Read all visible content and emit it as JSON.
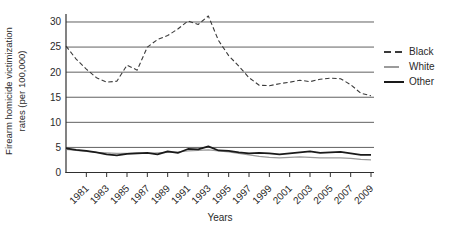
{
  "chart_data": {
    "type": "line",
    "title": "",
    "xlabel": "Years",
    "ylabel": "Firearm homicide victimization rates (per 100,000)",
    "ylabel_line1": "Firearm homicide victimization",
    "ylabel_line2": "rates (per 100,000)",
    "x": [
      1979,
      1980,
      1981,
      1982,
      1983,
      1984,
      1985,
      1986,
      1987,
      1988,
      1989,
      1990,
      1991,
      1992,
      1993,
      1994,
      1995,
      1996,
      1997,
      1998,
      1999,
      2000,
      2001,
      2002,
      2003,
      2004,
      2005,
      2006,
      2007,
      2008,
      2009
    ],
    "series": [
      {
        "name": "Black",
        "style": "dashed",
        "color": "#3a3a3a",
        "width": 1.1,
        "values": [
          25.2,
          22.6,
          20.6,
          18.9,
          18.0,
          18.2,
          21.4,
          20.4,
          25.0,
          26.5,
          27.3,
          28.6,
          30.2,
          29.5,
          31.2,
          26.3,
          23.3,
          21.2,
          18.9,
          17.4,
          17.3,
          17.7,
          18.0,
          18.4,
          18.1,
          18.6,
          18.8,
          18.7,
          17.5,
          15.8,
          15.3
        ]
      },
      {
        "name": "White",
        "style": "solid",
        "color": "#9b9b9b",
        "width": 1.3,
        "values": [
          4.6,
          4.4,
          4.2,
          4.0,
          3.9,
          3.8,
          3.8,
          3.9,
          3.8,
          3.9,
          4.0,
          4.1,
          4.3,
          4.4,
          4.5,
          4.3,
          4.1,
          3.8,
          3.5,
          3.2,
          3.0,
          2.9,
          3.0,
          3.1,
          3.0,
          2.9,
          2.9,
          2.9,
          2.8,
          2.6,
          2.5
        ]
      },
      {
        "name": "Other",
        "style": "solid",
        "color": "#1a1a1a",
        "width": 1.7,
        "values": [
          4.8,
          4.5,
          4.3,
          4.0,
          3.6,
          3.4,
          3.7,
          3.8,
          3.9,
          3.6,
          4.2,
          3.9,
          4.7,
          4.6,
          5.2,
          4.4,
          4.3,
          4.0,
          3.8,
          3.9,
          3.8,
          3.6,
          3.8,
          4.0,
          4.2,
          3.9,
          4.0,
          4.1,
          3.8,
          3.5,
          3.5
        ]
      }
    ],
    "yticks": [
      0,
      5,
      10,
      15,
      20,
      25,
      30
    ],
    "xticks": [
      1981,
      1983,
      1985,
      1987,
      1989,
      1991,
      1993,
      1995,
      1997,
      1999,
      2001,
      2003,
      2005,
      2007,
      2009
    ],
    "ylim": [
      0,
      31.6
    ],
    "grid": true,
    "grid_color": "#4f4f4f",
    "axis_color": "#2f2f2f",
    "text_color": "#2a2a2a",
    "legend_position": "right"
  },
  "axes": {
    "x_title": "Years",
    "y_title_line1": "Firearm homicide victimization",
    "y_title_line2": "rates (per 100,000)"
  },
  "legend": {
    "items": [
      {
        "label": "Black"
      },
      {
        "label": "White"
      },
      {
        "label": "Other"
      }
    ]
  }
}
